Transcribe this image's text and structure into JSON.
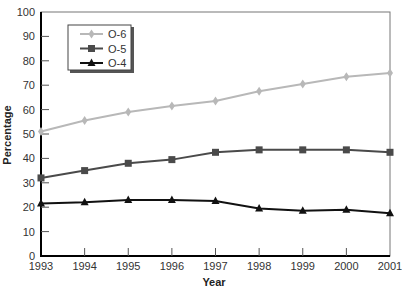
{
  "chart_data": {
    "type": "line",
    "title": "",
    "xlabel": "Year",
    "ylabel": "Percentage",
    "x": [
      "1993",
      "1994",
      "1995",
      "1996",
      "1997",
      "1998",
      "1999",
      "2000",
      "2001"
    ],
    "ylim": [
      0,
      100
    ],
    "yticks": [
      0,
      10,
      20,
      30,
      40,
      50,
      60,
      70,
      80,
      90,
      100
    ],
    "grid": false,
    "legend_position": "upper-left",
    "series": [
      {
        "name": "O-6",
        "color": "#b8b8b8",
        "marker": "diamond",
        "values": [
          51,
          55.5,
          59,
          61.5,
          63.5,
          67.5,
          70.5,
          73.5,
          75
        ]
      },
      {
        "name": "O-5",
        "color": "#4a4a4a",
        "marker": "square",
        "values": [
          32,
          35,
          38,
          39.5,
          42.5,
          43.5,
          43.5,
          43.5,
          42.5
        ]
      },
      {
        "name": "O-4",
        "color": "#111111",
        "marker": "triangle",
        "values": [
          21.5,
          22,
          23,
          23,
          22.5,
          19.5,
          18.5,
          19,
          17.5
        ]
      }
    ]
  }
}
